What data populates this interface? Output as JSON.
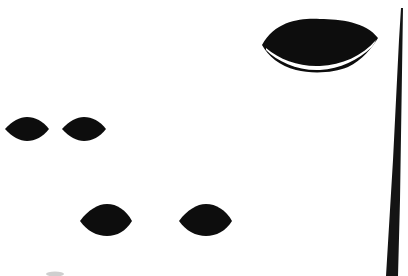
{
  "document": {
    "title": "Binarized Scan Fragment",
    "kind": "bitonal-scanned-image-fragment",
    "width": 408,
    "height": 276,
    "background_color": "#ffffff",
    "ink_color": "#0d0d0d",
    "smudge_color": "#cfcfcf",
    "description": "High-contrast black-on-white scan fragment: five solid black lens (vesica / almond) shapes of differing sizes, a thin white crescent hairline splitting the lower band of the largest lens, a tall tapering black wedge along the right edge, and a faint gray smudge near the bottom-left."
  },
  "shapes": [
    {
      "id": "lens-large",
      "name": "large-lens-shape",
      "role": "primary-ink-blob",
      "bbox": {
        "x": 262,
        "y": 19,
        "width": 116,
        "height": 53
      },
      "center": {
        "x": 320,
        "y": 45
      },
      "fill": "#0d0d0d",
      "has_inner_hairline": true,
      "hairline_color": "#ffffff",
      "hairline_label": "white crescent hairline"
    },
    {
      "id": "lens-small-1",
      "name": "small-lens-upper-left",
      "role": "ink-blob",
      "bbox": {
        "x": 5,
        "y": 117,
        "width": 44,
        "height": 24
      },
      "center": {
        "x": 27,
        "y": 129
      },
      "fill": "#0d0d0d",
      "has_inner_hairline": false
    },
    {
      "id": "lens-small-2",
      "name": "small-lens-upper-right",
      "role": "ink-blob",
      "bbox": {
        "x": 62,
        "y": 117,
        "width": 44,
        "height": 24
      },
      "center": {
        "x": 84,
        "y": 129
      },
      "fill": "#0d0d0d",
      "has_inner_hairline": false
    },
    {
      "id": "lens-mid-1",
      "name": "medium-lens-lower-left",
      "role": "ink-blob",
      "bbox": {
        "x": 80,
        "y": 204,
        "width": 52,
        "height": 32
      },
      "center": {
        "x": 106,
        "y": 220
      },
      "fill": "#0d0d0d",
      "has_inner_hairline": false
    },
    {
      "id": "lens-mid-2",
      "name": "medium-lens-lower-right",
      "role": "ink-blob",
      "bbox": {
        "x": 179,
        "y": 204,
        "width": 53,
        "height": 32
      },
      "center": {
        "x": 205,
        "y": 220
      },
      "fill": "#0d0d0d",
      "has_inner_hairline": false
    },
    {
      "id": "edge-wedge",
      "name": "right-edge-taper-wedge",
      "role": "page-edge-artifact",
      "bbox": {
        "x": 385,
        "y": 8,
        "width": 23,
        "height": 268
      },
      "fill": "#0d0d0d",
      "has_inner_hairline": false,
      "note": "hairline thin at top, widening toward the bottom of the frame"
    },
    {
      "id": "smudge-bottom",
      "name": "faint-bottom-smudge",
      "role": "scan-noise",
      "bbox": {
        "x": 46,
        "y": 271,
        "width": 18,
        "height": 5
      },
      "fill": "#cfcfcf",
      "has_inner_hairline": false
    }
  ]
}
